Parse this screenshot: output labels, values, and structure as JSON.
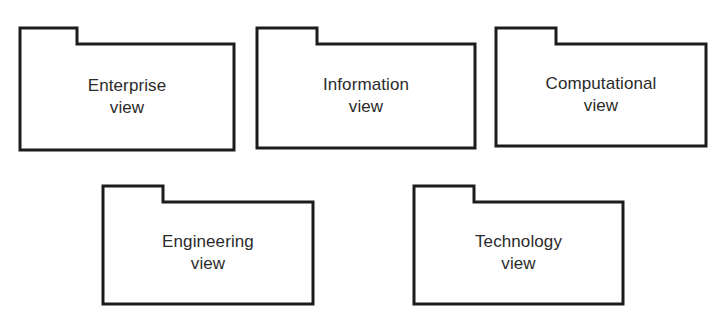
{
  "diagram": {
    "type": "uml-package-diagram",
    "background_color": "#ffffff",
    "stroke_color": "#1c1c1c",
    "text_color": "#2b2b2b",
    "fill_color": "#ffffff",
    "packages": [
      {
        "id": "enterprise-view",
        "label_line1": "Enterprise",
        "label_line2": "view",
        "label": "Enterprise\nview",
        "x": 20,
        "y": 28,
        "width": 214,
        "height": 122,
        "tab_width": 57,
        "tab_height": 16
      },
      {
        "id": "information-view",
        "label_line1": "Information",
        "label_line2": "view",
        "label": "Information\nview",
        "x": 257,
        "y": 28,
        "width": 218,
        "height": 120,
        "tab_width": 60,
        "tab_height": 16
      },
      {
        "id": "computational-view",
        "label_line1": "Computational",
        "label_line2": "view",
        "label": "Computational\nview",
        "x": 496,
        "y": 28,
        "width": 210,
        "height": 118,
        "tab_width": 60,
        "tab_height": 16
      },
      {
        "id": "engineering-view",
        "label_line1": "Engineering",
        "label_line2": "view",
        "label": "Engineering\nview",
        "x": 103,
        "y": 186,
        "width": 210,
        "height": 118,
        "tab_width": 60,
        "tab_height": 16
      },
      {
        "id": "technology-view",
        "label_line1": "Technology",
        "label_line2": "view",
        "label": "Technology\nview",
        "x": 414,
        "y": 186,
        "width": 209,
        "height": 118,
        "tab_width": 60,
        "tab_height": 16
      }
    ]
  }
}
